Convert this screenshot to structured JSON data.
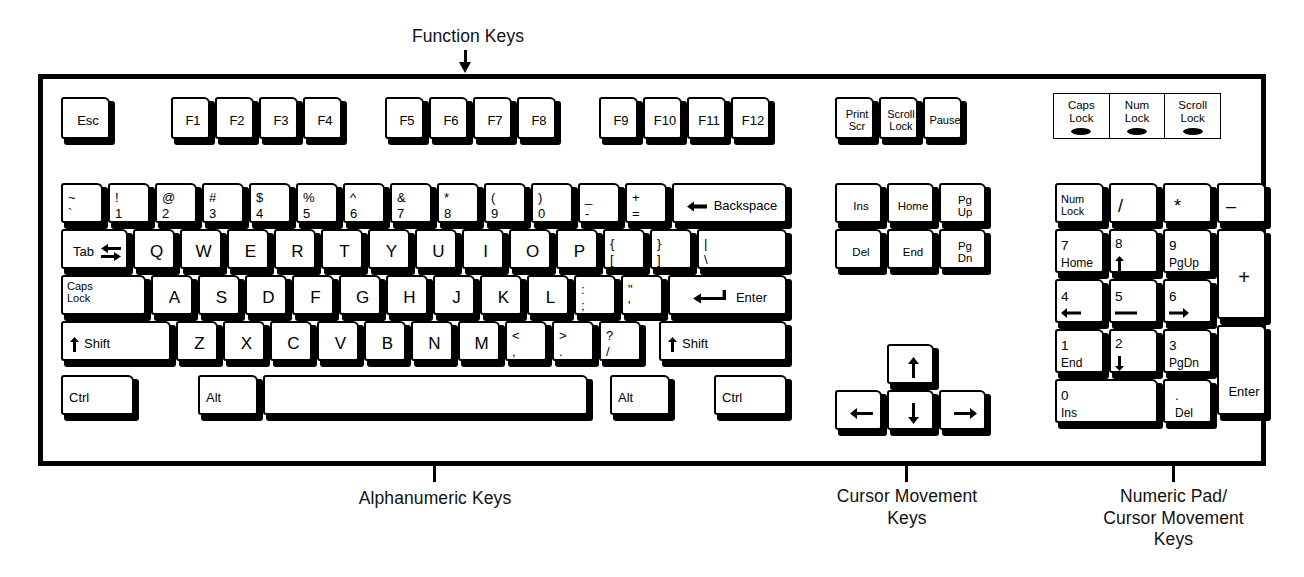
{
  "figure": {
    "title_caption": "Function Keys",
    "captions": [
      {
        "id": "function-keys",
        "text": "Function Keys"
      },
      {
        "id": "alphanumeric-keys",
        "text": "Alphanumeric Keys"
      },
      {
        "id": "cursor-movement-keys",
        "text": "Cursor Movement\nKeys"
      },
      {
        "id": "numeric-pad-keys",
        "text": "Numeric Pad/\nCursor Movement\nKeys"
      }
    ],
    "colors": {
      "ink": "#000000",
      "keycap": "#ffffff",
      "background": "#ffffff",
      "led": "#000000"
    }
  },
  "leds": [
    {
      "name": "caps-lock-led",
      "label": "Caps\nLock"
    },
    {
      "name": "num-lock-led",
      "label": "Num\nLock"
    },
    {
      "name": "scroll-lock-led",
      "label": "Scroll\nLock"
    }
  ],
  "function_row": {
    "esc": "Esc",
    "group1": [
      "F1",
      "F2",
      "F3",
      "F4"
    ],
    "group2": [
      "F5",
      "F6",
      "F7",
      "F8"
    ],
    "group3": [
      "F9",
      "F10",
      "F11",
      "F12"
    ],
    "system": [
      {
        "name": "print-screen-key",
        "label": "Print\nScr"
      },
      {
        "name": "scroll-lock-key",
        "label": "Scroll\nLock"
      },
      {
        "name": "pause-key",
        "label": "Pause"
      }
    ]
  },
  "number_row": [
    {
      "name": "tilde-key",
      "top": "~",
      "bottom": "`"
    },
    {
      "name": "one-key",
      "top": "!",
      "bottom": "1"
    },
    {
      "name": "two-key",
      "top": "@",
      "bottom": "2"
    },
    {
      "name": "three-key",
      "top": "#",
      "bottom": "3"
    },
    {
      "name": "four-key",
      "top": "$",
      "bottom": "4"
    },
    {
      "name": "five-key",
      "top": "%",
      "bottom": "5"
    },
    {
      "name": "six-key",
      "top": "^",
      "bottom": "6"
    },
    {
      "name": "seven-key",
      "top": "&",
      "bottom": "7"
    },
    {
      "name": "eight-key",
      "top": "*",
      "bottom": "8"
    },
    {
      "name": "nine-key",
      "top": "(",
      "bottom": "9"
    },
    {
      "name": "zero-key",
      "top": ")",
      "bottom": "0"
    },
    {
      "name": "minus-key",
      "top": "_",
      "bottom": "-"
    },
    {
      "name": "equals-key",
      "top": "+",
      "bottom": "="
    }
  ],
  "backspace_key": {
    "name": "backspace-key",
    "label": "Backspace",
    "icon": "arrow-left-icon"
  },
  "qwerty_row": {
    "tab": {
      "name": "tab-key",
      "label": "Tab",
      "icon": "tab-arrows-icon"
    },
    "letters": [
      "Q",
      "W",
      "E",
      "R",
      "T",
      "Y",
      "U",
      "I",
      "O",
      "P"
    ],
    "bracket_left": {
      "name": "bracket-left-key",
      "top": "{",
      "bottom": "["
    },
    "bracket_right": {
      "name": "bracket-right-key",
      "top": "}",
      "bottom": "]"
    },
    "backslash": {
      "name": "backslash-key",
      "top": "|",
      "bottom": "\\"
    }
  },
  "home_row": {
    "caps_lock": {
      "name": "caps-lock-key",
      "label": "Caps\nLock"
    },
    "letters": [
      "A",
      "S",
      "D",
      "F",
      "G",
      "H",
      "J",
      "K",
      "L"
    ],
    "semicolon": {
      "name": "semicolon-key",
      "top": ":",
      "bottom": ";"
    },
    "quote": {
      "name": "quote-key",
      "top": "\"",
      "bottom": "'"
    },
    "enter": {
      "name": "enter-key",
      "label": "Enter",
      "icon": "return-arrow-icon"
    }
  },
  "shift_row": {
    "shift_left": {
      "name": "shift-left-key",
      "label": "Shift",
      "icon": "arrow-up-icon"
    },
    "letters": [
      "Z",
      "X",
      "C",
      "V",
      "B",
      "N",
      "M"
    ],
    "comma": {
      "name": "comma-key",
      "top": "<",
      "bottom": ","
    },
    "period": {
      "name": "period-key",
      "top": ">",
      "bottom": "."
    },
    "slash": {
      "name": "slash-key",
      "top": "?",
      "bottom": "/"
    },
    "shift_right": {
      "name": "shift-right-key",
      "label": "Shift",
      "icon": "arrow-up-icon"
    }
  },
  "bottom_row": {
    "ctrl_left": "Ctrl",
    "alt_left": "Alt",
    "space": "",
    "alt_right": "Alt",
    "ctrl_right": "Ctrl"
  },
  "nav_cluster": [
    {
      "name": "insert-key",
      "label": "Ins"
    },
    {
      "name": "home-key",
      "label": "Home"
    },
    {
      "name": "page-up-key",
      "label": "Pg\nUp"
    },
    {
      "name": "delete-key",
      "label": "Del"
    },
    {
      "name": "end-key",
      "label": "End"
    },
    {
      "name": "page-down-key",
      "label": "Pg\nDn"
    }
  ],
  "arrow_cluster": [
    {
      "name": "arrow-up-key",
      "icon": "arrow-up-icon"
    },
    {
      "name": "arrow-left-key",
      "icon": "arrow-left-icon"
    },
    {
      "name": "arrow-down-key",
      "icon": "arrow-down-icon"
    },
    {
      "name": "arrow-right-key",
      "icon": "arrow-right-icon"
    }
  ],
  "numeric_pad": {
    "num_lock": {
      "name": "num-lock-key",
      "label": "Num\nLock"
    },
    "divide": {
      "name": "numpad-divide-key",
      "label": "/"
    },
    "multiply": {
      "name": "numpad-multiply-key",
      "label": "*"
    },
    "subtract": {
      "name": "numpad-subtract-key",
      "label": "–"
    },
    "add": {
      "name": "numpad-add-key",
      "label": "+"
    },
    "enter": {
      "name": "numpad-enter-key",
      "label": "Enter"
    },
    "keys": [
      {
        "name": "numpad-7-key",
        "top": "7",
        "bottom": "Home"
      },
      {
        "name": "numpad-8-key",
        "top": "8",
        "bottom": "arrow-up-icon"
      },
      {
        "name": "numpad-9-key",
        "top": "9",
        "bottom": "PgUp"
      },
      {
        "name": "numpad-4-key",
        "top": "4",
        "bottom": "arrow-left-icon"
      },
      {
        "name": "numpad-5-key",
        "top": "5",
        "bottom": "dash-icon"
      },
      {
        "name": "numpad-6-key",
        "top": "6",
        "bottom": "arrow-right-icon"
      },
      {
        "name": "numpad-1-key",
        "top": "1",
        "bottom": "End"
      },
      {
        "name": "numpad-2-key",
        "top": "2",
        "bottom": "arrow-down-icon"
      },
      {
        "name": "numpad-3-key",
        "top": "3",
        "bottom": "PgDn"
      },
      {
        "name": "numpad-0-key",
        "top": "0",
        "bottom": "Ins"
      },
      {
        "name": "numpad-decimal-key",
        "top": ".",
        "bottom": "Del"
      }
    ]
  }
}
